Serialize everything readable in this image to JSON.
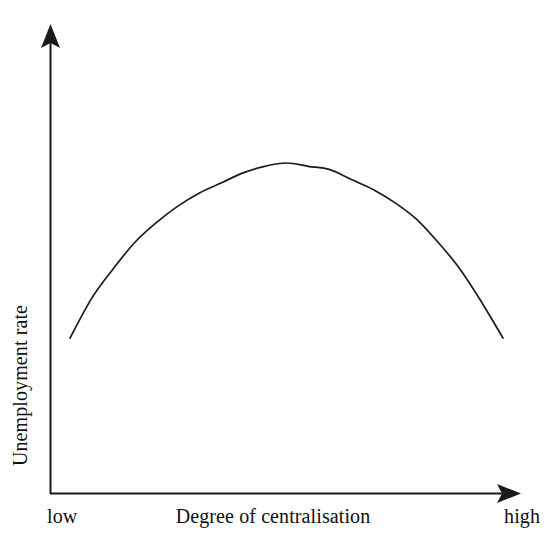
{
  "figure": {
    "width": 546,
    "height": 551,
    "background_color": "#ffffff",
    "line_color": "#1a1a1a"
  },
  "chart_data": {
    "type": "line",
    "title": "",
    "subtitle": "",
    "xlabel": "Degree of centralisation",
    "ylabel": "Unemployment rate",
    "xlim": [
      0,
      1
    ],
    "ylim": [
      0,
      1
    ],
    "grid": false,
    "legend": null,
    "xtick_labels": [
      "low",
      "high"
    ],
    "ytick_labels": [],
    "annotations": [],
    "axis_style": "arrow-headed open axes, no ticks, no gridlines",
    "series": [
      {
        "name": "Unemployment rate",
        "color": "#1a1a1a",
        "x": [
          0.0,
          0.05,
          0.1,
          0.15,
          0.2,
          0.25,
          0.3,
          0.35,
          0.4,
          0.45,
          0.5,
          0.55,
          0.6,
          0.65,
          0.7,
          0.75,
          0.8,
          0.85,
          0.9,
          0.95,
          1.0
        ],
        "y": [
          0.47,
          0.59,
          0.68,
          0.76,
          0.82,
          0.87,
          0.91,
          0.94,
          0.97,
          0.99,
          1.0,
          0.99,
          0.98,
          0.95,
          0.92,
          0.88,
          0.83,
          0.76,
          0.68,
          0.58,
          0.47
        ]
      }
    ],
    "pixel_geometry": {
      "y_axis_x": 50,
      "x_axis_y": 494,
      "y_axis_top": 25,
      "x_axis_right": 521,
      "curve_left_point": [
        70,
        338
      ],
      "curve_apex": [
        285,
        163
      ],
      "curve_right_point": [
        503,
        338
      ]
    }
  },
  "labels": {
    "y_axis": "Unemployment rate",
    "x_axis": "Degree of centralisation",
    "x_min": "low",
    "x_max": "high"
  }
}
